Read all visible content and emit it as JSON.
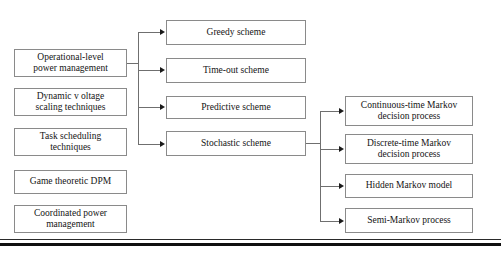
{
  "diagram": {
    "type": "hierarchy-tree",
    "background_color": "#ffffff",
    "box_border_color": "#8a8a8a",
    "connector_color": "#6f6f6f",
    "arrow_color": "#1a1a1a",
    "rule_color": "#101010",
    "columns": {
      "left": {
        "name": "technique-categories",
        "nodes": [
          {
            "id": "operational-level-power-management",
            "label": "Operational-level power management",
            "line1": "Operational-level",
            "line2": "power management",
            "x": 14,
            "y": 49,
            "w": 113,
            "h": 28,
            "has_children": true
          },
          {
            "id": "dynamic-voltage-scaling-techniques",
            "label": "Dynamic v oltage scaling techniques",
            "line1": "Dynamic v oltage",
            "line2": "scaling techniques",
            "x": 14,
            "y": 88,
            "w": 113,
            "h": 28,
            "has_children": false
          },
          {
            "id": "task-scheduling-techniques",
            "label": "Task scheduling techniques",
            "line1": "Task scheduling",
            "line2": "techniques",
            "x": 14,
            "y": 128,
            "w": 113,
            "h": 28,
            "has_children": false
          },
          {
            "id": "game-theoretic-dpm",
            "label": "Game theoretic DPM",
            "line1": "Game theoretic DPM",
            "line2": "",
            "x": 14,
            "y": 170,
            "w": 113,
            "h": 24,
            "has_children": false
          },
          {
            "id": "coordinated-power-management",
            "label": "Coordinated power management",
            "line1": "Coordinated power",
            "line2": "management",
            "x": 14,
            "y": 205,
            "w": 113,
            "h": 28,
            "has_children": false
          }
        ]
      },
      "middle": {
        "name": "dpm-schemes",
        "parent": "operational-level-power-management",
        "nodes": [
          {
            "id": "greedy-scheme",
            "label": "Greedy scheme",
            "x": 166,
            "y": 20,
            "w": 140,
            "h": 25,
            "has_children": false
          },
          {
            "id": "time-out-scheme",
            "label": "Time-out scheme",
            "x": 166,
            "y": 58,
            "w": 140,
            "h": 25,
            "has_children": false
          },
          {
            "id": "predictive-scheme",
            "label": "Predictive scheme",
            "x": 166,
            "y": 96,
            "w": 140,
            "h": 23,
            "has_children": false
          },
          {
            "id": "stochastic-scheme",
            "label": "Stochastic scheme",
            "x": 166,
            "y": 131,
            "w": 140,
            "h": 25,
            "has_children": true
          }
        ]
      },
      "right": {
        "name": "stochastic-models",
        "parent": "stochastic-scheme",
        "nodes": [
          {
            "id": "continuous-time-markov-decision-process",
            "label": "Continuous-time Markov decision process",
            "line1": "Continuous-time Markov",
            "line2": "decision process",
            "x": 345,
            "y": 96,
            "w": 128,
            "h": 30
          },
          {
            "id": "discrete-time-markov-decision-process",
            "label": "Discrete-time Markov decision process",
            "line1": "Discrete-time Markov",
            "line2": "decision process",
            "x": 345,
            "y": 134,
            "w": 128,
            "h": 30
          },
          {
            "id": "hidden-markov-model",
            "label": "Hidden Markov model",
            "line1": "Hidden Markov model",
            "line2": "",
            "x": 345,
            "y": 174,
            "w": 128,
            "h": 24
          },
          {
            "id": "semi-markov-process",
            "label": "Semi-Markov process",
            "line1": "Semi-Markov process",
            "line2": "",
            "x": 345,
            "y": 208,
            "w": 128,
            "h": 25
          }
        ]
      }
    },
    "edges": [
      {
        "from": "operational-level-power-management",
        "to": "greedy-scheme"
      },
      {
        "from": "operational-level-power-management",
        "to": "time-out-scheme"
      },
      {
        "from": "operational-level-power-management",
        "to": "predictive-scheme"
      },
      {
        "from": "operational-level-power-management",
        "to": "stochastic-scheme"
      },
      {
        "from": "stochastic-scheme",
        "to": "continuous-time-markov-decision-process"
      },
      {
        "from": "stochastic-scheme",
        "to": "discrete-time-markov-decision-process"
      },
      {
        "from": "stochastic-scheme",
        "to": "hidden-markov-model"
      },
      {
        "from": "stochastic-scheme",
        "to": "semi-markov-process"
      }
    ]
  }
}
